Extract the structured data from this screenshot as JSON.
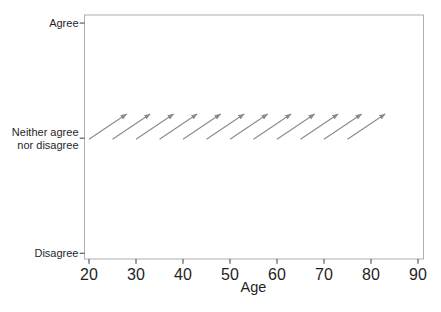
{
  "chart_data": {
    "type": "quiver",
    "title": "",
    "xlabel": "Age",
    "ylabel": "",
    "grid": false,
    "legend": "none",
    "x_ticks": [
      20,
      30,
      40,
      50,
      60,
      70,
      80,
      90
    ],
    "xlim": [
      19.04,
      91.17
    ],
    "ylim": [
      0.95,
      3.07
    ],
    "y_ticks": [
      {
        "value": 3,
        "lines": [
          "Agree"
        ]
      },
      {
        "value": 2,
        "lines": [
          "Neither agree",
          "nor disagree"
        ]
      },
      {
        "value": 1,
        "lines": [
          "Disagree"
        ]
      }
    ],
    "arrows": [
      {
        "x": 20,
        "y": 1.99,
        "dx": 8,
        "dy": 0.22
      },
      {
        "x": 25,
        "y": 1.99,
        "dx": 8,
        "dy": 0.22
      },
      {
        "x": 30,
        "y": 1.99,
        "dx": 8,
        "dy": 0.22
      },
      {
        "x": 35,
        "y": 1.99,
        "dx": 8,
        "dy": 0.22
      },
      {
        "x": 40,
        "y": 1.99,
        "dx": 8,
        "dy": 0.22
      },
      {
        "x": 45,
        "y": 1.99,
        "dx": 8,
        "dy": 0.22
      },
      {
        "x": 50,
        "y": 1.99,
        "dx": 8,
        "dy": 0.22
      },
      {
        "x": 55,
        "y": 1.99,
        "dx": 8,
        "dy": 0.22
      },
      {
        "x": 60,
        "y": 1.99,
        "dx": 8,
        "dy": 0.22
      },
      {
        "x": 65,
        "y": 1.99,
        "dx": 8,
        "dy": 0.22
      },
      {
        "x": 70,
        "y": 1.99,
        "dx": 8,
        "dy": 0.22
      },
      {
        "x": 75,
        "y": 1.99,
        "dx": 8,
        "dy": 0.22
      }
    ],
    "colors": {
      "arrow": "#8a8a8a",
      "frame": "#aeaeae",
      "tick": "#3d3d3d",
      "text": "#1f1f1f",
      "background": "#ffffff"
    }
  }
}
